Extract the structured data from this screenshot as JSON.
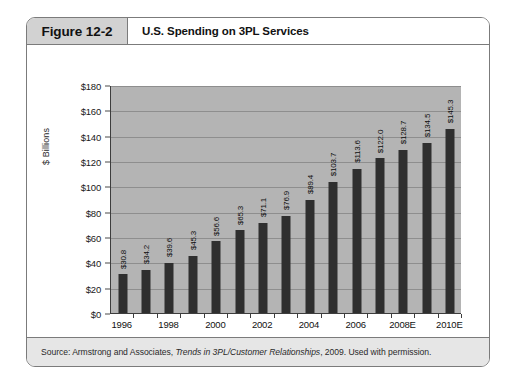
{
  "figure": {
    "number_label": "Figure 12-2",
    "title": "U.S. Spending on 3PL Services",
    "source": {
      "prefix": "Source: Armstrong and Associates, ",
      "italic": "Trends in 3PL/Customer Relationships",
      "suffix": ", 2009. Used with permission."
    }
  },
  "chart_data": {
    "type": "bar",
    "title": "U.S. Spending on 3PL Services",
    "xlabel": "",
    "ylabel": "$ Billions",
    "ylim": [
      0,
      180
    ],
    "ytick_step": 20,
    "ytick_labels": [
      "$0",
      "$20",
      "$40",
      "$60",
      "$80",
      "$100",
      "$120",
      "$140",
      "$160",
      "$180"
    ],
    "grid": true,
    "legend": null,
    "categories": [
      "1996",
      "1997",
      "1998",
      "1999",
      "2000",
      "2001",
      "2002",
      "2003",
      "2004",
      "2005",
      "2006",
      "2007",
      "2008E",
      "2009E",
      "2010E"
    ],
    "xtick_labels_shown": [
      "1996",
      "",
      "1998",
      "",
      "2000",
      "",
      "2002",
      "",
      "2004",
      "",
      "2006",
      "",
      "2008E",
      "",
      "2010E"
    ],
    "values": [
      30.8,
      34.2,
      39.6,
      45.3,
      56.6,
      65.3,
      71.1,
      76.9,
      89.4,
      103.7,
      113.6,
      122.0,
      128.7,
      134.5,
      145.3
    ],
    "data_labels": [
      "$30.8",
      "$34.2",
      "$39.6",
      "$45.3",
      "$56.6",
      "$65.3",
      "$71.1",
      "$76.9",
      "$89.4",
      "$103.7",
      "$113.6",
      "$122.0",
      "$128.7",
      "$134.5",
      "$145.3"
    ],
    "colors": {
      "bar": "#2f2f2f",
      "plot_background": "#b4b4b4",
      "gridline": "#8e8e8e",
      "axis": "#3d3d3d",
      "header_box": "#d2d2d2",
      "source_bar": "#e6e6e6"
    }
  }
}
